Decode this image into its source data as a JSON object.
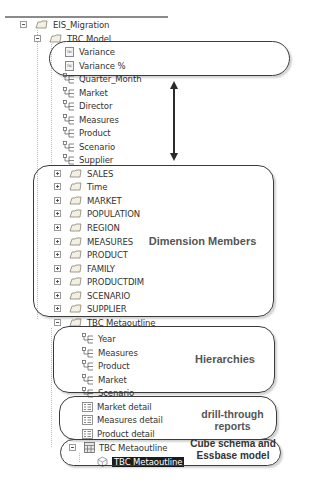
{
  "tree": {
    "root": {
      "label": "EIS_Migration",
      "expanded": true
    },
    "model": {
      "label": "TBC Model",
      "expanded": true,
      "calculated": [
        {
          "label": "Variance"
        },
        {
          "label": "Variance %"
        }
      ],
      "hierarchies": [
        {
          "label": "Quarter_Month"
        },
        {
          "label": "Market"
        },
        {
          "label": "Director"
        },
        {
          "label": "Measures"
        },
        {
          "label": "Product"
        },
        {
          "label": "Scenario"
        },
        {
          "label": "Supplier"
        }
      ],
      "dimensions": [
        {
          "label": "SALES"
        },
        {
          "label": "Time"
        },
        {
          "label": "MARKET"
        },
        {
          "label": "POPULATION"
        },
        {
          "label": "REGION"
        },
        {
          "label": "MEASURES"
        },
        {
          "label": "PRODUCT"
        },
        {
          "label": "FAMILY"
        },
        {
          "label": "PRODUCTDIM"
        },
        {
          "label": "SCENARIO"
        },
        {
          "label": "SUPPLIER"
        }
      ]
    },
    "metaoutline_folder": {
      "label": "TBC Metaoutline",
      "expanded": true,
      "hierarchies": [
        {
          "label": "Year"
        },
        {
          "label": "Measures"
        },
        {
          "label": "Product"
        },
        {
          "label": "Market"
        },
        {
          "label": "Scenario"
        }
      ],
      "drill_reports": [
        {
          "label": "Market detail"
        },
        {
          "label": "Measures detail"
        },
        {
          "label": "Product detail"
        }
      ],
      "cube": {
        "label": "TBC Metaoutline",
        "expanded": true
      },
      "model": {
        "label": "TBC Metaoutline",
        "selected": true
      }
    }
  },
  "callouts": {
    "dimension_members": "Dimension Members",
    "hierarchies": "Hierarchies",
    "drill_through_line1": "drill-through",
    "drill_through_line2": "reports",
    "cube_line1": "Cube schema and",
    "cube_line2": "Essbase model"
  },
  "colors": {
    "outline": "#3a3a3a",
    "label": "#555555",
    "selection": "#1c1c1c"
  }
}
